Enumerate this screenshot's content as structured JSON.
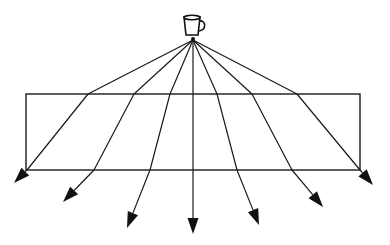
{
  "diagram": {
    "title": "",
    "colors": {
      "line": "#1a1a1a",
      "background": "#ffffff"
    },
    "source": {
      "icon": "mug-icon",
      "label": ""
    },
    "ray_count": 7
  }
}
